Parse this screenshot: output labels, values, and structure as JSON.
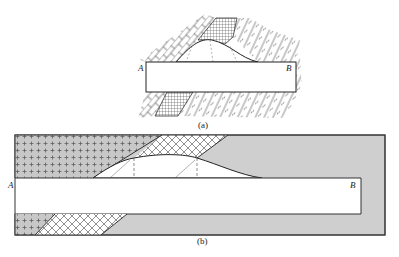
{
  "figure_a": {
    "caption": "(a)",
    "label_left": "A",
    "label_right": "B",
    "regions": [
      "brick-pattern-rock",
      "grid-pattern-layer",
      "schist-pattern-rock",
      "tunnel-opening",
      "collapse-zone"
    ]
  },
  "figure_b": {
    "caption": "(b)",
    "label_left": "A",
    "label_right": "B",
    "regions": [
      "plus-pattern-rock",
      "crosshatch-layer",
      "gray-rock",
      "tunnel-opening",
      "collapse-zone"
    ]
  },
  "colors": {
    "gray_fill": "#cfcfcf",
    "plus_fill": "#c8c8c8",
    "line": "#333333",
    "background": "#ffffff"
  }
}
